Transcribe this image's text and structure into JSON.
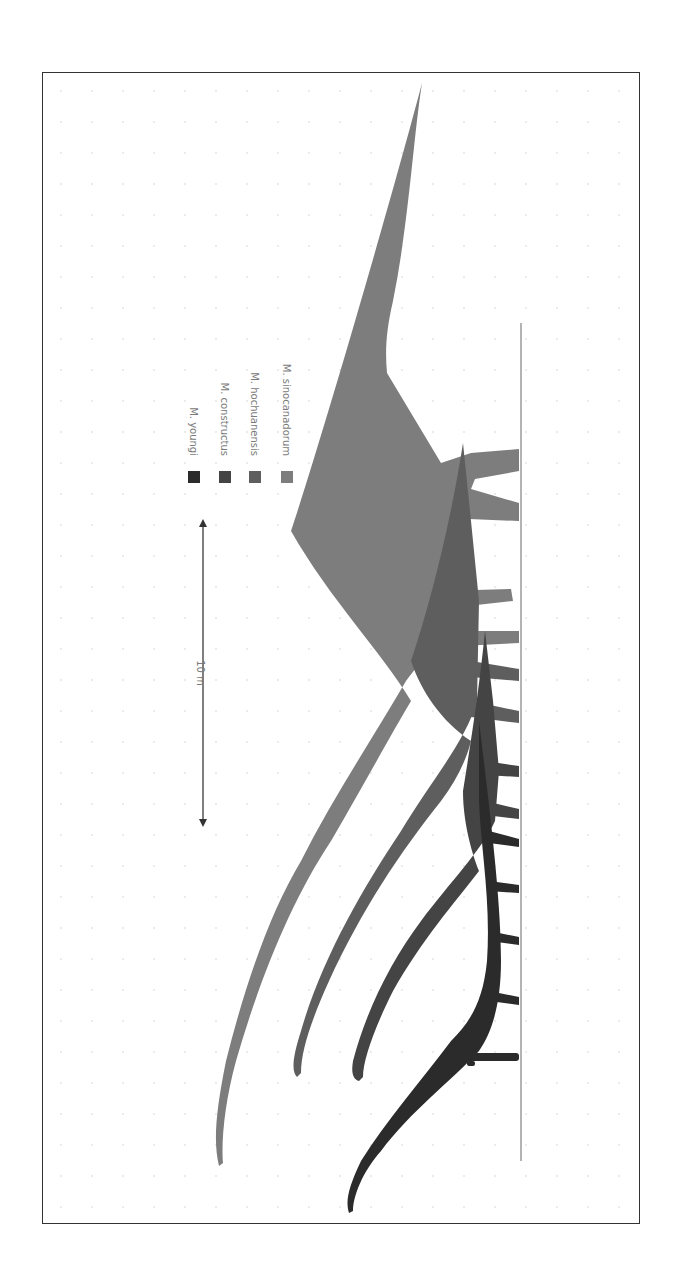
{
  "figure": {
    "orientation": "rotated 90° clockwise (ground line on right, heads toward bottom)",
    "scale_bar": {
      "label": "10 m",
      "length_px": 300
    },
    "legend": [
      {
        "label": "M. youngi",
        "color": "#2b2b2b"
      },
      {
        "label": "M. constructus",
        "color": "#444444"
      },
      {
        "label": "M. hochuanensis",
        "color": "#5e5e5e"
      },
      {
        "label": "M. sinocanadorum",
        "color": "#7d7d7d"
      }
    ],
    "silhouettes": [
      {
        "name": "M. sinocanadorum",
        "color": "#7d7d7d"
      },
      {
        "name": "M. hochuanensis",
        "color": "#5e5e5e"
      },
      {
        "name": "M. constructus",
        "color": "#444444"
      },
      {
        "name": "M. youngi",
        "color": "#2b2b2b"
      },
      {
        "name": "human",
        "color": "#2b2b2b"
      }
    ],
    "colors": {
      "frame": "#333333",
      "ground": "#9a9a9a",
      "grid_dots": "#e4e4e4"
    }
  }
}
